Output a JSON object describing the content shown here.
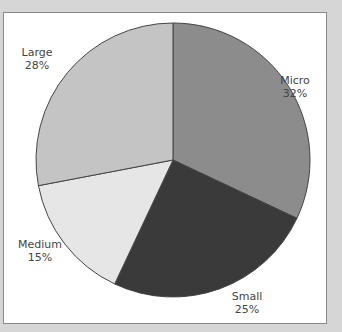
{
  "chart_data": {
    "type": "pie",
    "title": "",
    "categories": [
      "Micro",
      "Small",
      "Medium",
      "Large"
    ],
    "values": [
      32,
      25,
      15,
      28
    ],
    "labels": [
      "32%",
      "25%",
      "15%",
      "28%"
    ],
    "colors": [
      "#8c8c8c",
      "#3a3a3a",
      "#e6e6e6",
      "#c4c4c4"
    ],
    "start_angle_deg": 0,
    "direction": "clockwise"
  },
  "labels": {
    "micro": {
      "name": "Micro",
      "pct": "32%"
    },
    "small": {
      "name": "Small",
      "pct": "25%"
    },
    "medium": {
      "name": "Medium",
      "pct": "15%"
    },
    "large": {
      "name": "Large",
      "pct": "28%"
    }
  }
}
